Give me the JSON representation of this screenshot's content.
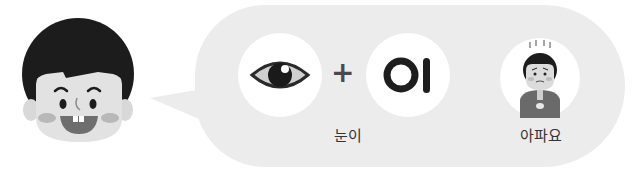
{
  "illustration": {
    "speaker": "boy-smiling",
    "bubble_items": [
      {
        "icon": "eye-icon",
        "alt": "눈"
      },
      {
        "operator": "+"
      },
      {
        "syllable": "이"
      },
      {
        "icon": "sick-child-icon",
        "alt": "아파요"
      }
    ],
    "labels": {
      "word": "눈이",
      "meaning": "아파요"
    },
    "colors": {
      "bubble": "#ececec",
      "circle": "#ffffff",
      "hair": "#1c1c1c",
      "skin": "#e2e2e2",
      "text": "#333333"
    }
  }
}
